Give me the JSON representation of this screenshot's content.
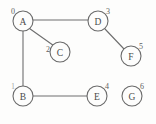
{
  "figure": {
    "name": "undirected-graph-diagram",
    "background_color": "#fdfdfc",
    "stroke_color": "#6a6a6a",
    "text_color": "#4a4a4a",
    "width": 156,
    "height": 124
  },
  "graph": {
    "type": "undirected",
    "node_radius": 10,
    "nodes": [
      {
        "id": "A",
        "label": "A",
        "index": "0",
        "cx": 23,
        "cy": 21,
        "index_dx": -10,
        "index_dy": -10,
        "faint": false
      },
      {
        "id": "B",
        "label": "B",
        "index": "1",
        "cx": 23,
        "cy": 96,
        "index_dx": -10,
        "index_dy": -10,
        "faint": true
      },
      {
        "id": "C",
        "label": "C",
        "index": "2",
        "cx": 60,
        "cy": 52,
        "index_dx": -12,
        "index_dy": -3,
        "faint": false
      },
      {
        "id": "D",
        "label": "D",
        "index": "3",
        "cx": 98,
        "cy": 21,
        "index_dx": 10,
        "index_dy": -10,
        "faint": false
      },
      {
        "id": "E",
        "label": "E",
        "index": "4",
        "cx": 97,
        "cy": 96,
        "index_dx": 10,
        "index_dy": -10,
        "faint": false
      },
      {
        "id": "F",
        "label": "F",
        "index": "5",
        "cx": 131,
        "cy": 56,
        "index_dx": 10,
        "index_dy": -10,
        "faint": false
      },
      {
        "id": "G",
        "label": "G",
        "index": "6",
        "cx": 132,
        "cy": 96,
        "index_dx": 10,
        "index_dy": -10,
        "faint": false
      }
    ],
    "edges": [
      {
        "from": "A",
        "to": "D",
        "x1": 33,
        "y1": 20,
        "x2": 88,
        "y2": 20
      },
      {
        "from": "A",
        "to": "C",
        "x1": 29.5,
        "y1": 28.5,
        "x2": 53.5,
        "y2": 45.5
      },
      {
        "from": "A",
        "to": "B",
        "x1": 23,
        "y1": 31,
        "x2": 23,
        "y2": 86
      },
      {
        "from": "B",
        "to": "E",
        "x1": 33,
        "y1": 96,
        "x2": 87,
        "y2": 96
      },
      {
        "from": "D",
        "to": "F",
        "x1": 105,
        "y1": 29,
        "x2": 124,
        "y2": 49
      }
    ],
    "isolated_nodes": [
      "G"
    ]
  }
}
